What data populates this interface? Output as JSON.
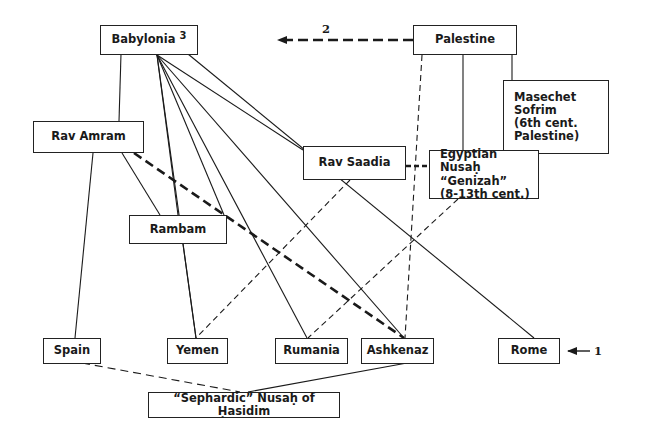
{
  "diagram": {
    "type": "lineage-diagram",
    "nodes": {
      "babylonia": {
        "label": "Babylonia",
        "superscript": "3"
      },
      "palestine": {
        "label": "Palestine"
      },
      "masechet_sofrim": {
        "lines": [
          "Masechet",
          "Sofrim",
          "(6th cent.",
          "Palestine)"
        ]
      },
      "rav_amram": {
        "label": "Rav Amram"
      },
      "rav_saadia": {
        "label": "Rav Saadia"
      },
      "egyptian_nusah": {
        "lines": [
          "Egyptian Nusaḥ",
          "“Genizah”",
          "(8-13th cent.)"
        ]
      },
      "rambam": {
        "label": "Rambam"
      },
      "spain": {
        "label": "Spain"
      },
      "yemen": {
        "label": "Yemen"
      },
      "rumania": {
        "label": "Rumania"
      },
      "ashkenaz": {
        "label": "Ashkenaz"
      },
      "rome": {
        "label": "Rome"
      },
      "sephardic_hasidim": {
        "label": "“Sephardic” Nusaḥ of Ḥasidim"
      }
    },
    "annotations": {
      "arrow_palestine_to_babylonia": "2",
      "arrow_to_rome": "1"
    },
    "edges": [
      {
        "from": "babylonia",
        "to": "rav_amram",
        "style": "solid"
      },
      {
        "from": "babylonia",
        "to": "yemen",
        "style": "solid"
      },
      {
        "from": "babylonia",
        "to": "rumania",
        "style": "solid"
      },
      {
        "from": "babylonia",
        "to": "ashkenaz",
        "style": "solid"
      },
      {
        "from": "babylonia",
        "to": "rav_saadia",
        "style": "solid"
      },
      {
        "from": "babylonia",
        "to": "rome",
        "style": "solid"
      },
      {
        "from": "palestine",
        "to": "babylonia",
        "style": "bold-dashed-arrow",
        "label": "2"
      },
      {
        "from": "palestine",
        "to": "masechet_sofrim",
        "style": "solid"
      },
      {
        "from": "palestine",
        "to": "egyptian_nusah",
        "style": "solid"
      },
      {
        "from": "palestine",
        "to": "ashkenaz",
        "style": "dashed"
      },
      {
        "from": "rav_amram",
        "to": "spain",
        "style": "solid"
      },
      {
        "from": "rav_amram",
        "to": "rambam",
        "style": "solid"
      },
      {
        "from": "rav_amram",
        "to": "ashkenaz",
        "style": "bold-dashed"
      },
      {
        "from": "rav_saadia",
        "to": "egyptian_nusah",
        "style": "bold-dashed"
      },
      {
        "from": "rav_saadia",
        "to": "yemen",
        "style": "dashed"
      },
      {
        "from": "egyptian_nusah",
        "to": "rumania",
        "style": "dashed"
      },
      {
        "from": "rambam",
        "to": "yemen",
        "style": "solid"
      },
      {
        "from": "spain",
        "to": "sephardic_hasidim",
        "style": "dashed"
      },
      {
        "from": "ashkenaz",
        "to": "sephardic_hasidim",
        "style": "solid"
      }
    ]
  }
}
